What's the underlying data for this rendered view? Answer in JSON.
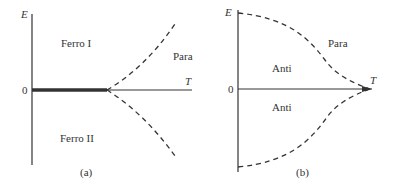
{
  "panel_a": {
    "y_axis_label": "E",
    "x_axis_label": "T",
    "origin_label": "0",
    "region_upper": "Ferro I",
    "region_lower": "Ferro II",
    "region_right": "Para",
    "caption": "(a)"
  },
  "panel_b": {
    "y_axis_label": "E",
    "x_axis_label": "T",
    "origin_label": "0",
    "region_upper": "Anti",
    "region_lower": "Anti",
    "region_right": "Para",
    "caption": "(b)"
  },
  "colors": {
    "line": "#333333",
    "background": "#ffffff"
  }
}
